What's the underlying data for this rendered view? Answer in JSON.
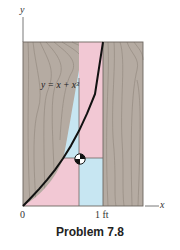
{
  "figure": {
    "equation": "y = x + x³",
    "axis_x_label": "x",
    "axis_y_label": "y",
    "origin_label": "0",
    "tick_label": "1 ft",
    "caption": "Problem 7.8"
  },
  "colors": {
    "wood": "#b5aba2",
    "wood_grain": "#8a7f76",
    "pink": "#f2c8d4",
    "blue": "#c7e6f2",
    "curve": "#111111",
    "frame": "#6e6660"
  },
  "icons": {
    "centroid": "centroid-marker-icon"
  }
}
